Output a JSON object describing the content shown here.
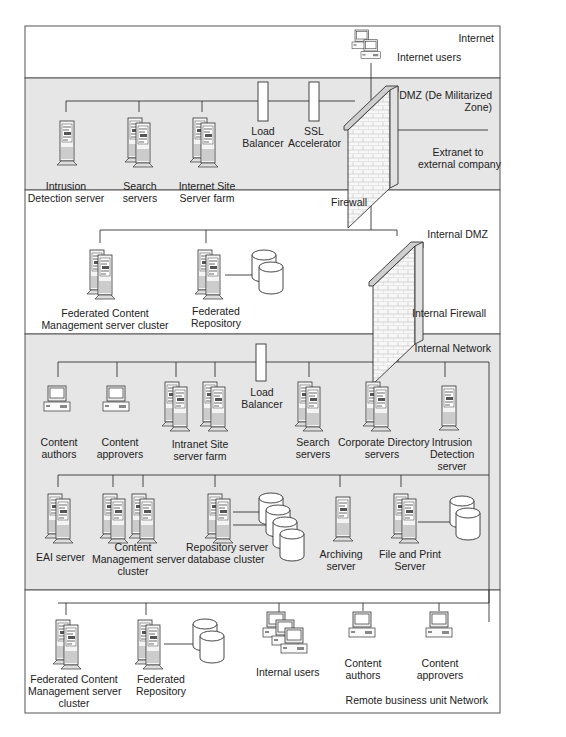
{
  "colors": {
    "shaded_zone": "#e6e6e6",
    "plain_zone": "#ffffff",
    "line": "#333333"
  },
  "zones": [
    {
      "id": "internet",
      "label": "Internet",
      "shaded": false
    },
    {
      "id": "dmz",
      "label_line1": "DMZ (De Militarized",
      "label_line2": "Zone)",
      "shaded": true
    },
    {
      "id": "internal_dmz",
      "label": "Internal DMZ",
      "shaded": false
    },
    {
      "id": "internal_network",
      "label": "Internal Network",
      "shaded": true
    },
    {
      "id": "remote",
      "label": "Remote business unit Network",
      "shaded": false
    }
  ],
  "internet": {
    "internet_users": "Internet users"
  },
  "dmz": {
    "intrusion_detection": [
      "Intrusion",
      "Detection server"
    ],
    "search_servers": [
      "Search",
      "servers"
    ],
    "internet_site": [
      "Internet Site",
      "Server farm"
    ],
    "load_balancer": [
      "Load",
      "Balancer"
    ],
    "ssl_accelerator": [
      "SSL",
      "Accelerator"
    ],
    "extranet": [
      "Extranet to",
      "external company"
    ],
    "firewall": "Firewall"
  },
  "internal_dmz": {
    "fed_cm_cluster": [
      "Federated Content",
      "Management server cluster"
    ],
    "fed_repository": [
      "Federated",
      "Repository"
    ],
    "internal_firewall": "Internal Firewall"
  },
  "internal_network": {
    "content_authors": [
      "Content",
      "authors"
    ],
    "content_approvers": [
      "Content",
      "approvers"
    ],
    "intranet_site": [
      "Intranet Site",
      "server farm"
    ],
    "load_balancer": [
      "Load",
      "Balancer"
    ],
    "search_servers": [
      "Search",
      "servers"
    ],
    "corporate_directory": [
      "Corporate Directory",
      "servers"
    ],
    "intrusion_detection": [
      "Intrusion",
      "Detection",
      "server"
    ],
    "eai_server": "EAI server",
    "cm_cluster": [
      "Content",
      "Management server",
      "cluster"
    ],
    "repository_cluster": [
      "Repository server",
      "database cluster"
    ],
    "archiving_server": [
      "Archiving",
      "server"
    ],
    "file_print_server": [
      "File and Print",
      "Server"
    ]
  },
  "remote": {
    "fed_cm_cluster": [
      "Federated Content",
      "Management server",
      "cluster"
    ],
    "fed_repository": [
      "Federated",
      "Repository"
    ],
    "internal_users": "Internal users",
    "content_authors": [
      "Content",
      "authors"
    ],
    "content_approvers": [
      "Content",
      "approvers"
    ]
  }
}
